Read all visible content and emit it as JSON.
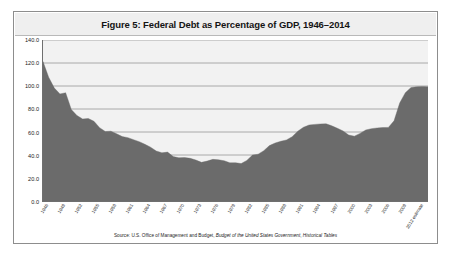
{
  "figure": {
    "title": "Figure 5: Federal Debt as Percentage of GDP, 1946–2014",
    "source_prefix": "Source: U.S. Office of Management and Budget, ",
    "source_italic_1": "Budget of the United States Government",
    "source_middle": ", ",
    "source_italic_2": "Historical Tables"
  },
  "colors": {
    "area_fill": "#6b6b6b",
    "plot_background": "#f2f2f2",
    "gridline": "#8a8a8a",
    "axis": "#6f6f6f",
    "title_band": "#efefef",
    "frame_border": "#8d8d8d",
    "page_background": "#ffffff",
    "text": "#1d1d1d"
  },
  "chart_data": {
    "type": "area",
    "title": "Figure 5: Federal Debt as Percentage of GDP, 1946–2014",
    "xlabel": "",
    "ylabel": "",
    "ylim": [
      0,
      140
    ],
    "ytick_labels": [
      "0.0",
      "20.0",
      "40.0",
      "60.0",
      "80.0",
      "100.0",
      "120.0",
      "140.0"
    ],
    "ytick_values": [
      0,
      20,
      40,
      60,
      80,
      100,
      120,
      140
    ],
    "grid": true,
    "legend": "none",
    "xtick_labels": [
      "1946",
      "1949",
      "1952",
      "1955",
      "1958",
      "1961",
      "1964",
      "1967",
      "1970",
      "1973",
      "1976",
      "1979",
      "1982",
      "1985",
      "1988",
      "1991",
      "1994",
      "1997",
      "2000",
      "2003",
      "2006",
      "2009",
      "2012 estimate",
      "2013 estimate",
      "2014 estimate"
    ],
    "x": [
      1946,
      1947,
      1948,
      1949,
      1950,
      1951,
      1952,
      1953,
      1954,
      1955,
      1956,
      1957,
      1958,
      1959,
      1960,
      1961,
      1962,
      1963,
      1964,
      1965,
      1966,
      1967,
      1968,
      1969,
      1970,
      1971,
      1972,
      1973,
      1974,
      1975,
      1976,
      1977,
      1978,
      1979,
      1980,
      1981,
      1982,
      1983,
      1984,
      1985,
      1986,
      1987,
      1988,
      1989,
      1990,
      1991,
      1992,
      1993,
      1994,
      1995,
      1996,
      1997,
      1998,
      1999,
      2000,
      2001,
      2002,
      2003,
      2004,
      2005,
      2006,
      2007,
      2008,
      2009,
      2010,
      2011,
      2012,
      2013,
      2014
    ],
    "values": [
      121.2,
      107.6,
      98.2,
      93.1,
      94.1,
      79.6,
      74.3,
      71.3,
      71.8,
      69.3,
      63.8,
      60.4,
      60.7,
      58.4,
      56.0,
      55.1,
      53.3,
      51.6,
      49.3,
      46.8,
      43.5,
      41.9,
      42.5,
      38.6,
      37.6,
      37.8,
      37.1,
      35.6,
      33.6,
      34.7,
      36.2,
      35.8,
      35.0,
      33.2,
      33.3,
      32.5,
      35.3,
      39.9,
      40.7,
      43.8,
      48.2,
      50.4,
      51.9,
      53.1,
      55.9,
      60.7,
      64.1,
      66.1,
      66.6,
      67.0,
      67.1,
      65.4,
      63.2,
      60.9,
      57.3,
      56.4,
      58.8,
      61.7,
      62.9,
      63.5,
      63.9,
      64.0,
      69.7,
      85.2,
      94.2,
      98.7,
      99.4,
      99.6,
      99.3
    ],
    "annotations": [
      "Last three x-axis categories are labeled as estimates: 2012 estimate, 2013 estimate, 2014 estimate."
    ]
  }
}
